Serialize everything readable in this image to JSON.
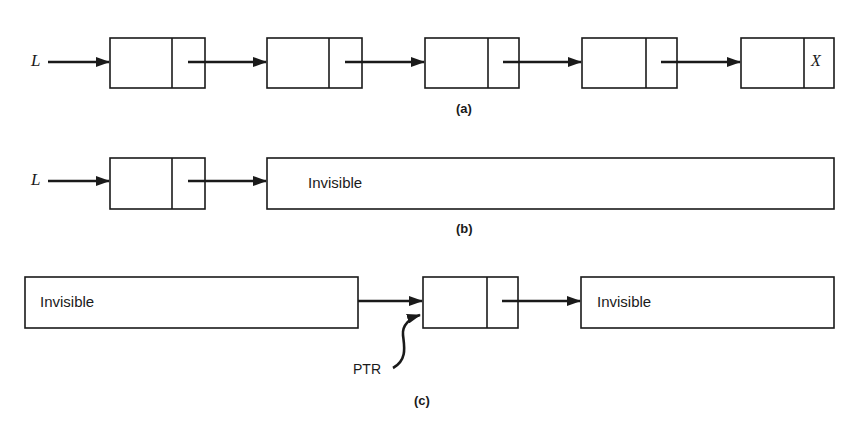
{
  "diagram": {
    "colors": {
      "stroke": "#1a1a1a",
      "background": "#ffffff"
    },
    "panel_a": {
      "caption": "(a)",
      "head_label": "L",
      "nodes": [
        {
          "next": "pointer"
        },
        {
          "next": "pointer"
        },
        {
          "next": "pointer"
        },
        {
          "next": "pointer"
        },
        {
          "next": "X"
        }
      ],
      "null_marker": "X"
    },
    "panel_b": {
      "caption": "(b)",
      "head_label": "L",
      "nodes": [
        {
          "next": "pointer"
        }
      ],
      "rest_label": "Invisible"
    },
    "panel_c": {
      "caption": "(c)",
      "left_label": "Invisible",
      "right_label": "Invisible",
      "pointer_label": "PTR"
    }
  }
}
